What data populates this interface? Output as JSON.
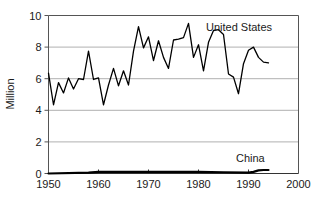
{
  "chart_data": {
    "type": "line",
    "title": "",
    "subtitle": "",
    "xlabel": "",
    "ylabel": "Million",
    "xlim": [
      1950,
      2000
    ],
    "ylim": [
      0,
      10
    ],
    "xticks": [
      "1950",
      "1960",
      "1970",
      "1980",
      "1990",
      "2000"
    ],
    "xtick_values": [
      1950,
      1960,
      1970,
      1980,
      1990,
      2000
    ],
    "yticks": [
      "0",
      "2",
      "4",
      "6",
      "8",
      "10"
    ],
    "ytick_values": [
      0,
      2,
      4,
      6,
      8,
      10
    ],
    "grid": "horizontal",
    "legend_position": "inline-annotation",
    "line_color": "#000000",
    "grid_color": "#b0b0b0",
    "axis_color": "#555555",
    "x": [
      1950,
      1951,
      1952,
      1953,
      1954,
      1955,
      1956,
      1957,
      1958,
      1959,
      1960,
      1961,
      1962,
      1963,
      1964,
      1965,
      1966,
      1967,
      1968,
      1969,
      1970,
      1971,
      1972,
      1973,
      1974,
      1975,
      1976,
      1977,
      1978,
      1979,
      1980,
      1981,
      1982,
      1983,
      1984,
      1985,
      1986,
      1987,
      1988,
      1989,
      1990,
      1991,
      1992,
      1993,
      1994
    ],
    "series": [
      {
        "name": "United States",
        "label": "United States",
        "label_x": 1981.5,
        "label_y": 9.05,
        "values": [
          6.35,
          4.35,
          5.75,
          5.1,
          6.05,
          5.35,
          6.0,
          5.95,
          7.75,
          5.95,
          6.05,
          4.35,
          5.6,
          6.65,
          5.55,
          6.5,
          5.6,
          7.75,
          9.3,
          7.95,
          8.65,
          7.15,
          8.4,
          7.35,
          6.65,
          8.45,
          8.5,
          8.6,
          9.5,
          7.35,
          8.15,
          6.5,
          8.3,
          9.05,
          9.1,
          8.8,
          6.3,
          6.1,
          5.05,
          6.95,
          7.8,
          8.0,
          7.35,
          7.05,
          7.0
        ],
        "note": "values read from plot, units: million"
      },
      {
        "name": "China",
        "label": "China",
        "label_x": 1987.5,
        "label_y": 0.75,
        "x": [
          1950,
          1958,
          1960,
          1970,
          1980,
          1985,
          1990,
          1991,
          1992,
          1993,
          1994
        ],
        "values": [
          0.0,
          0.05,
          0.1,
          0.1,
          0.1,
          0.08,
          0.05,
          0.1,
          0.2,
          0.22,
          0.22
        ],
        "note": "values read from plot, units: million"
      }
    ]
  },
  "axes": {
    "y_axis_title": "Million"
  }
}
